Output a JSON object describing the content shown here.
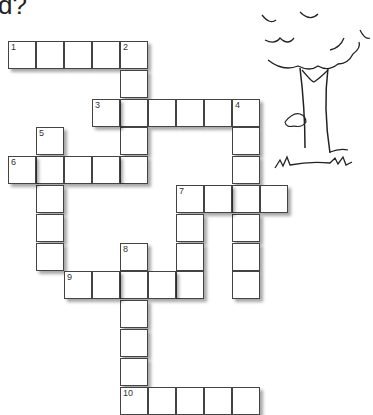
{
  "heading": "d?",
  "cell_size": 28,
  "grid_origin": {
    "x": 8,
    "y": 41
  },
  "clues": [
    {
      "number": "1",
      "direction": "across",
      "row": 0,
      "col": 0,
      "length": 5
    },
    {
      "number": "2",
      "direction": "down",
      "row": 0,
      "col": 4,
      "length": 5
    },
    {
      "number": "3",
      "direction": "across",
      "row": 2,
      "col": 3,
      "length": 6
    },
    {
      "number": "4",
      "direction": "down",
      "row": 2,
      "col": 8,
      "length": 7
    },
    {
      "number": "5",
      "direction": "down",
      "row": 3,
      "col": 1,
      "length": 5
    },
    {
      "number": "6",
      "direction": "across",
      "row": 4,
      "col": 0,
      "length": 5
    },
    {
      "number": "7",
      "direction": "across",
      "row": 5,
      "col": 6,
      "length": 4
    },
    {
      "number": "7",
      "direction": "down",
      "row": 5,
      "col": 6,
      "length": 4
    },
    {
      "number": "8",
      "direction": "down",
      "row": 7,
      "col": 4,
      "length": 6
    },
    {
      "number": "9",
      "direction": "across",
      "row": 8,
      "col": 2,
      "length": 5
    },
    {
      "number": "10",
      "direction": "across",
      "row": 12,
      "col": 4,
      "length": 5
    }
  ],
  "illustration": "tree-with-crocodile"
}
